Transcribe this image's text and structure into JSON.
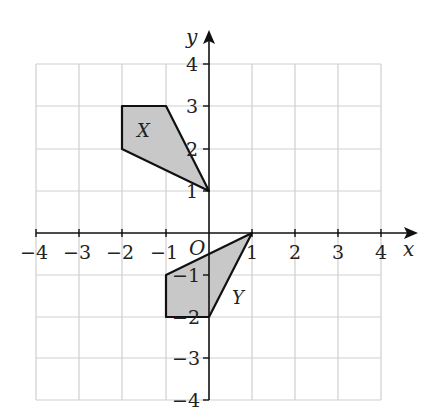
{
  "diagram": {
    "type": "coordinate-grid",
    "axes": {
      "x_label": "x",
      "y_label": "y",
      "origin_label": "O",
      "x_range": [
        -4,
        4
      ],
      "y_range": [
        -4,
        4
      ]
    },
    "x_ticks": [
      "−4",
      "−3",
      "−2",
      "−1",
      "1",
      "2",
      "3",
      "4"
    ],
    "y_ticks": [
      "4",
      "3",
      "2",
      "1",
      "−1",
      "−2",
      "−3",
      "−4"
    ],
    "shapes": [
      {
        "name": "X",
        "vertices": [
          [
            -2,
            3
          ],
          [
            -1,
            3
          ],
          [
            0,
            1
          ],
          [
            -2,
            2
          ]
        ],
        "fill": "#c8c8c8",
        "stroke": "#111111"
      },
      {
        "name": "Y",
        "vertices": [
          [
            1,
            0
          ],
          [
            0,
            -2
          ],
          [
            -1,
            -2
          ],
          [
            -1,
            -1
          ]
        ],
        "fill": "#c8c8c8",
        "stroke": "#111111"
      }
    ],
    "colors": {
      "grid": "#cfcfcf",
      "axis": "#111111",
      "shape_fill": "#c8c8c8"
    }
  }
}
